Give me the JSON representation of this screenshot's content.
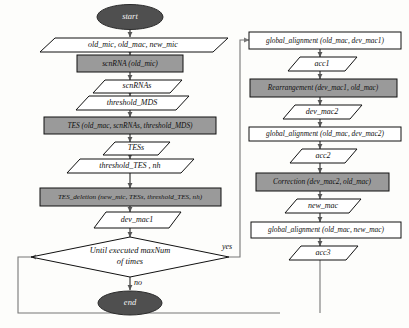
{
  "diagram": {
    "colors": {
      "process_fill": "#9a9a9a",
      "terminal_fill": "#4f4f4f",
      "io_fill": "#ffffff",
      "stroke": "#111111",
      "edge": "#555555",
      "background": "#fdfdfb"
    },
    "left_column": {
      "start": "start",
      "inputs": "old_mic, old_mac, new_mic",
      "scnrna_call": "scnRNA (old_mic)",
      "scnrnas": "scnRNAs",
      "threshold_mds": "threshold_MDS",
      "tes_call": "TES (old_mac, scnRNAs, threshold_MDS)",
      "tess": "TESs",
      "threshold_tes": "threshold_TES , nh",
      "tes_deletion_call": "TES_deletion (new_mic, TESs, threshold_TES, nh)",
      "dev_mac1": "dev_mac1",
      "decision_line1": "Until executed maxNum",
      "decision_line2": "of times",
      "branch_yes": "yes",
      "branch_no": "no",
      "end": "end"
    },
    "right_column": {
      "global_alignment_1": "global_alignment (old_mac, dev_mac1)",
      "acc1": "acc1",
      "rearrangement": "Rearrangement (dev_mac1, old_mac)",
      "dev_mac2": "dev_mac2",
      "global_alignment_2": "global_alignment (old_mac, dev_mac2)",
      "acc2": "acc2",
      "correction": "Correction (dev_mac2, old_mac)",
      "new_mac": "new_mac",
      "global_alignment_3": "global_alignment (old_mac, new_mac)",
      "acc3": "acc3"
    }
  }
}
